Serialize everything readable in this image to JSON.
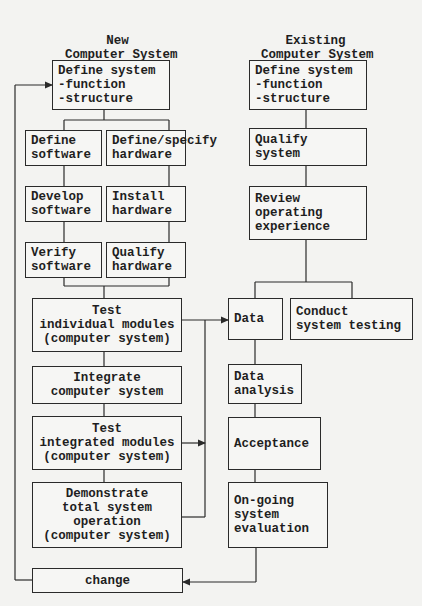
{
  "columns": {
    "new": {
      "title_lines": [
        "New",
        "Computer System"
      ]
    },
    "existing": {
      "title_lines": [
        "Existing",
        "Computer System"
      ]
    }
  },
  "new_system": {
    "define_system": [
      "Define system",
      "-function",
      "-structure"
    ],
    "software": [
      [
        "Define",
        "software"
      ],
      [
        "Develop",
        "software"
      ],
      [
        "Verify",
        "software"
      ]
    ],
    "hardware": [
      [
        "Define/specify",
        "hardware"
      ],
      [
        "Install",
        "hardware"
      ],
      [
        "Qualify",
        "hardware"
      ]
    ],
    "test_individual": [
      "Test",
      "individual modules",
      "(computer system)"
    ],
    "integrate": [
      "Integrate",
      "computer system"
    ],
    "test_integrated": [
      "Test",
      "integrated modules",
      "(computer system)"
    ],
    "demonstrate": [
      "Demonstrate",
      "total system",
      "operation",
      "(computer system)"
    ],
    "change": [
      "change"
    ]
  },
  "existing_system": {
    "define_system": [
      "Define system",
      "-function",
      "-structure"
    ],
    "qualify_system": [
      "Qualify",
      "system"
    ],
    "review_experience": [
      "Review",
      "operating",
      "experience"
    ],
    "data": [
      "Data"
    ],
    "conduct_testing": [
      "Conduct",
      "system testing"
    ],
    "data_analysis": [
      "Data",
      "analysis"
    ],
    "acceptance": [
      "Acceptance"
    ],
    "ongoing_evaluation": [
      "On-going",
      "system",
      "evaluation"
    ]
  },
  "colors": {
    "line": "#2a2a2a",
    "background": "#f3f3f1",
    "text": "#1e1e1e"
  }
}
